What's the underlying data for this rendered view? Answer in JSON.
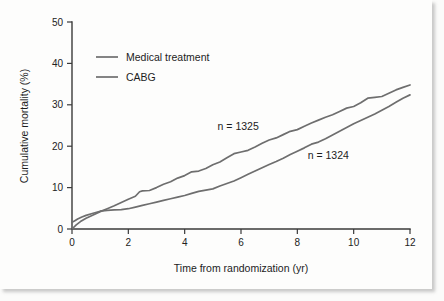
{
  "chart_data": {
    "type": "line",
    "title": "",
    "subtitle": "",
    "xlabel": "Time from randomization (yr)",
    "ylabel": "Cumulative mortality (%)",
    "xlim": [
      0,
      12
    ],
    "ylim": [
      0,
      50
    ],
    "xticks": [
      0,
      2,
      4,
      6,
      8,
      10,
      12
    ],
    "xtick_labels": [
      "0",
      "2",
      "4",
      "6",
      "8",
      "10",
      "12"
    ],
    "yticks": [
      0,
      10,
      20,
      30,
      40,
      50
    ],
    "ytick_labels": [
      "0",
      "10",
      "20",
      "30",
      "40",
      "50"
    ],
    "grid": false,
    "legend_position": "upper-left",
    "series": [
      {
        "name": "Medical treatment",
        "color": "#6e6e6e",
        "n": 1325,
        "x": [
          0.0,
          0.15,
          0.3,
          0.5,
          0.75,
          1.0,
          1.25,
          1.5,
          1.75,
          2.0,
          2.25,
          2.4,
          2.5,
          2.75,
          3.0,
          3.25,
          3.5,
          3.75,
          4.0,
          4.25,
          4.5,
          4.75,
          5.0,
          5.25,
          5.5,
          5.75,
          6.0,
          6.25,
          6.5,
          6.75,
          7.0,
          7.25,
          7.5,
          7.75,
          8.0,
          8.25,
          8.5,
          8.75,
          9.0,
          9.25,
          9.5,
          9.75,
          10.0,
          10.25,
          10.5,
          10.75,
          11.0,
          11.25,
          11.5,
          11.75,
          12.0
        ],
        "y": [
          0.0,
          1.0,
          1.8,
          2.6,
          3.4,
          4.2,
          4.9,
          5.6,
          6.4,
          7.2,
          7.9,
          9.0,
          9.2,
          9.3,
          10.0,
          10.8,
          11.4,
          12.3,
          12.9,
          13.8,
          14.0,
          14.6,
          15.5,
          16.2,
          17.2,
          18.2,
          18.6,
          19.0,
          19.8,
          20.7,
          21.5,
          22.0,
          22.8,
          23.6,
          24.0,
          24.8,
          25.6,
          26.3,
          27.0,
          27.6,
          28.4,
          29.2,
          29.6,
          30.5,
          31.6,
          31.8,
          32.0,
          32.8,
          33.6,
          34.2,
          34.8
        ]
      },
      {
        "name": "CABG",
        "color": "#6e6e6e",
        "n": 1324,
        "x": [
          0.0,
          0.1,
          0.2,
          0.35,
          0.5,
          0.75,
          1.0,
          1.25,
          1.5,
          1.75,
          2.0,
          2.25,
          2.5,
          2.75,
          3.0,
          3.25,
          3.5,
          3.75,
          4.0,
          4.25,
          4.5,
          4.75,
          5.0,
          5.25,
          5.5,
          5.75,
          6.0,
          6.25,
          6.5,
          6.75,
          7.0,
          7.25,
          7.5,
          7.75,
          8.0,
          8.25,
          8.5,
          8.75,
          9.0,
          9.25,
          9.5,
          9.75,
          10.0,
          10.25,
          10.5,
          10.75,
          11.0,
          11.25,
          11.5,
          11.75,
          12.0
        ],
        "y": [
          1.6,
          2.0,
          2.4,
          2.9,
          3.3,
          3.8,
          4.3,
          4.5,
          4.6,
          4.7,
          4.9,
          5.3,
          5.7,
          6.1,
          6.5,
          6.9,
          7.3,
          7.7,
          8.1,
          8.6,
          9.1,
          9.4,
          9.7,
          10.4,
          11.0,
          11.6,
          12.4,
          13.2,
          14.0,
          14.8,
          15.6,
          16.3,
          17.1,
          18.0,
          18.8,
          19.6,
          20.5,
          21.0,
          21.8,
          22.7,
          23.6,
          24.5,
          25.4,
          26.2,
          27.0,
          27.8,
          28.7,
          29.6,
          30.6,
          31.6,
          32.4
        ]
      }
    ],
    "annotations": [
      {
        "text": "n = 1325",
        "x": 5.9,
        "y": 24.0,
        "series": "Medical treatment"
      },
      {
        "text": "n = 1324",
        "x": 9.1,
        "y": 17.0,
        "series": "CABG"
      }
    ],
    "legend": [
      {
        "label": "Medical treatment",
        "color": "#6e6e6e"
      },
      {
        "label": "CABG",
        "color": "#6e6e6e"
      }
    ]
  },
  "figure": {
    "background_color": "#fdfdfc",
    "axis_color": "#3a3a3a"
  }
}
